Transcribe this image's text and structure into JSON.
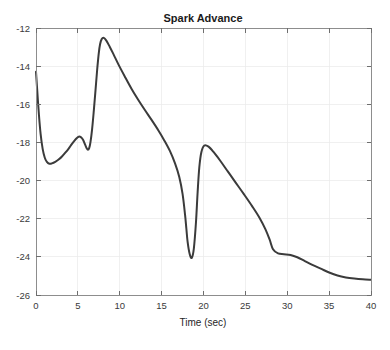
{
  "chart_data": {
    "type": "line",
    "title": "Spark Advance",
    "xlabel": "Time (sec)",
    "ylabel": "",
    "xlim": [
      0,
      40
    ],
    "ylim": [
      -26,
      -12
    ],
    "xticks": [
      0,
      5,
      10,
      15,
      20,
      25,
      30,
      35,
      40
    ],
    "yticks": [
      -26,
      -24,
      -22,
      -20,
      -18,
      -16,
      -14,
      -12
    ],
    "xtick_labels": [
      "0",
      "5",
      "10",
      "15",
      "20",
      "25",
      "30",
      "35",
      "40"
    ],
    "ytick_labels": [
      "-26",
      "-24",
      "-22",
      "-20",
      "-18",
      "-16",
      "-14",
      "-12"
    ],
    "grid": true,
    "legend": null,
    "line_color": "#3b3b3b",
    "background_color": "#ffffff",
    "series": [
      {
        "name": "Spark Advance",
        "x": [
          0.0,
          0.15,
          0.35,
          0.55,
          0.8,
          1.05,
          1.3,
          1.6,
          1.9,
          2.3,
          2.7,
          3.1,
          3.5,
          3.9,
          4.25,
          4.6,
          4.85,
          5.1,
          5.35,
          5.6,
          5.85,
          6.05,
          6.2,
          6.35,
          6.5,
          6.7,
          6.9,
          7.1,
          7.3,
          7.5,
          7.65,
          7.85,
          8.1,
          8.4,
          8.8,
          9.3,
          9.9,
          10.6,
          11.4,
          12.2,
          13.0,
          13.8,
          14.6,
          15.3,
          16.0,
          16.6,
          17.1,
          17.5,
          17.8,
          17.95,
          18.1,
          18.35,
          18.6,
          18.85,
          19.1,
          19.3,
          19.5,
          19.75,
          20.1,
          20.6,
          21.2,
          22.0,
          22.9,
          23.8,
          24.8,
          25.8,
          26.7,
          27.4,
          27.9,
          28.3,
          28.9,
          29.6,
          30.4,
          31.2,
          32.1,
          33.0,
          34.0,
          35.0,
          36.0,
          37.0,
          38.0,
          39.0,
          40.0
        ],
        "y": [
          -14.3,
          -15.3,
          -16.55,
          -17.55,
          -18.35,
          -18.8,
          -19.02,
          -19.12,
          -19.1,
          -19.02,
          -18.9,
          -18.74,
          -18.54,
          -18.32,
          -18.1,
          -17.9,
          -17.78,
          -17.7,
          -17.72,
          -17.85,
          -18.1,
          -18.3,
          -18.38,
          -18.3,
          -18.0,
          -17.3,
          -16.35,
          -15.3,
          -14.2,
          -13.3,
          -12.85,
          -12.58,
          -12.52,
          -12.66,
          -12.98,
          -13.42,
          -13.96,
          -14.54,
          -15.18,
          -15.76,
          -16.3,
          -16.82,
          -17.36,
          -17.88,
          -18.46,
          -19.1,
          -19.8,
          -20.7,
          -21.8,
          -22.5,
          -23.2,
          -23.85,
          -24.05,
          -23.55,
          -22.2,
          -20.6,
          -19.3,
          -18.5,
          -18.16,
          -18.22,
          -18.5,
          -18.96,
          -19.52,
          -20.08,
          -20.7,
          -21.34,
          -21.96,
          -22.56,
          -23.1,
          -23.6,
          -23.82,
          -23.86,
          -23.9,
          -24.02,
          -24.22,
          -24.42,
          -24.62,
          -24.82,
          -24.98,
          -25.08,
          -25.14,
          -25.18,
          -25.2
        ]
      }
    ]
  },
  "figure": {
    "title": "Spark Advance",
    "xlabel": "Time (sec)"
  }
}
